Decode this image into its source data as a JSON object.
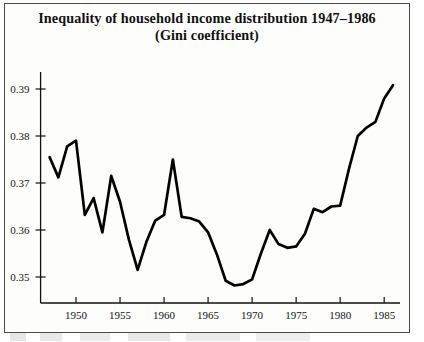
{
  "figure": {
    "title_line_1": "Inequality of household income distribution 1947–1986",
    "title_line_2": "(Gini coefficient)"
  },
  "chart_data": {
    "type": "line",
    "title": "Inequality of household income distribution 1947–1986 (Gini coefficient)",
    "subtitle": "(Gini coefficient)",
    "xlabel": "",
    "ylabel": "",
    "xlim": [
      1947,
      1986
    ],
    "ylim": [
      0.3455,
      0.3925
    ],
    "grid": false,
    "legend": null,
    "x_tick_labels": [
      "1950",
      "1955",
      "1960",
      "1965",
      "1970",
      "1975",
      "1980",
      "1985"
    ],
    "x_ticks": [
      1950,
      1955,
      1960,
      1965,
      1970,
      1975,
      1980,
      1985
    ],
    "y_tick_labels": [
      "0.35",
      "0.36",
      "0.37",
      "0.38",
      "0.39"
    ],
    "y_ticks": [
      0.35,
      0.36,
      0.37,
      0.38,
      0.39
    ],
    "line_color": "#000000",
    "x": [
      1947,
      1948,
      1949,
      1950,
      1951,
      1952,
      1953,
      1954,
      1955,
      1956,
      1957,
      1958,
      1959,
      1960,
      1961,
      1962,
      1963,
      1964,
      1965,
      1966,
      1967,
      1968,
      1969,
      1970,
      1971,
      1972,
      1973,
      1974,
      1975,
      1976,
      1977,
      1978,
      1979,
      1980,
      1981,
      1982,
      1983,
      1984,
      1985,
      1986
    ],
    "values": [
      0.3755,
      0.3712,
      0.3778,
      0.379,
      0.3632,
      0.3668,
      0.3595,
      0.3715,
      0.366,
      0.358,
      0.3515,
      0.3575,
      0.362,
      0.3632,
      0.375,
      0.3628,
      0.3625,
      0.3618,
      0.3595,
      0.3548,
      0.3492,
      0.3482,
      0.3485,
      0.3495,
      0.355,
      0.36,
      0.357,
      0.3562,
      0.3565,
      0.3592,
      0.3645,
      0.3638,
      0.365,
      0.3652,
      0.373,
      0.38,
      0.3818,
      0.383,
      0.388,
      0.3908
    ]
  }
}
